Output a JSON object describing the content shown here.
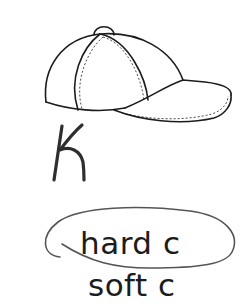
{
  "worksheet": {
    "picture": {
      "icon": "baseball-cap-icon",
      "label": "cap"
    },
    "handwritten_letter": "K",
    "options": [
      {
        "label": "hard c",
        "circled": true
      },
      {
        "label": "soft c",
        "circled": false
      }
    ],
    "colors": {
      "ink": "#1c1c1c",
      "pencil": "#555555",
      "background": "#ffffff"
    }
  }
}
